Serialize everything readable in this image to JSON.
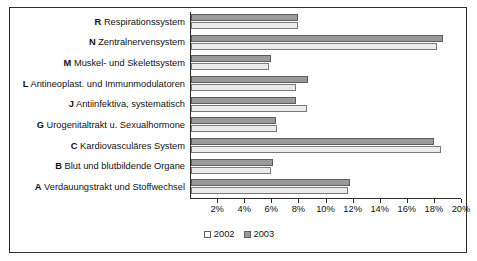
{
  "chart_data": {
    "type": "bar",
    "orientation": "horizontal",
    "title": "",
    "xlabel": "",
    "ylabel": "",
    "xlim": [
      0,
      20
    ],
    "xticks": [
      "2%",
      "4%",
      "6%",
      "8%",
      "10%",
      "12%",
      "14%",
      "16%",
      "18%",
      "20%"
    ],
    "xtick_values": [
      2,
      4,
      6,
      8,
      10,
      12,
      14,
      16,
      18,
      20
    ],
    "grid": false,
    "legend_position": "bottom-center",
    "categories": [
      "R Respirationssystem",
      "N Zentralnervensystem",
      "M Muskel- und Skelettsystem",
      "L Antineoplast. und Immunmodulatoren",
      "J Antiinfektiva, systematisch",
      "G Urogenitaltrakt u. Sexualhormone",
      "C Kardiovasculäres System",
      "B Blut und blutbildende Organe",
      "A Verdauungstrakt und Stoffwechsel"
    ],
    "category_codes": [
      "R",
      "N",
      "M",
      "L",
      "J",
      "G",
      "C",
      "B",
      "A"
    ],
    "category_names": [
      "Respirationssystem",
      "Zentralnervensystem",
      "Muskel- und Skelettsystem",
      "Antineoplast. und Immunmodulatoren",
      "Antiinfektiva, systematisch",
      "Urogenitaltrakt u. Sexualhormone",
      "Kardiovasculäres System",
      "Blut und blutbildende Organe",
      "Verdauungstrakt und Stoffwechsel"
    ],
    "series": [
      {
        "name": "2002",
        "color": "#ebebeb",
        "values": [
          7.9,
          18.2,
          5.8,
          7.8,
          8.6,
          6.4,
          18.5,
          5.9,
          11.6
        ]
      },
      {
        "name": "2003",
        "color": "#9a9a9a",
        "values": [
          7.9,
          18.7,
          5.9,
          8.7,
          7.8,
          6.3,
          18.0,
          6.1,
          11.8
        ]
      }
    ]
  },
  "legend": {
    "items": [
      {
        "label": "2002",
        "swatch": "legend-swatch-2002"
      },
      {
        "label": "2003",
        "swatch": "legend-swatch-2003"
      }
    ]
  }
}
